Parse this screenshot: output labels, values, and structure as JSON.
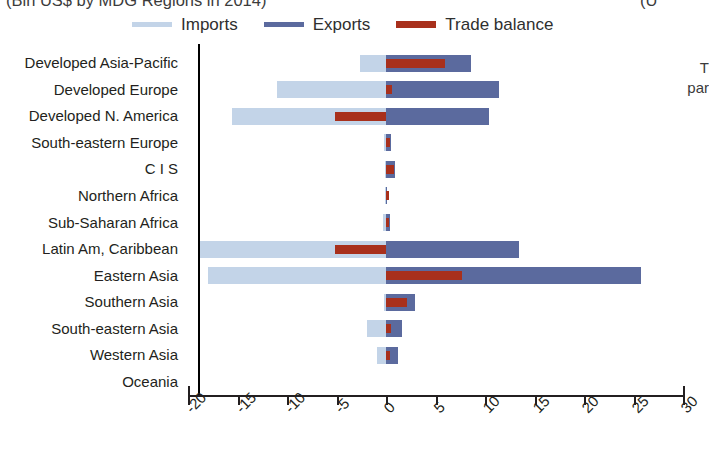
{
  "title": {
    "main_clipped": "(Bln US$ by MDG Regions in 2014)",
    "right_clipped": "(U"
  },
  "side_note": {
    "line1": "T",
    "line2": "par"
  },
  "legend": {
    "position": "top",
    "items": [
      {
        "label": "Imports",
        "color": "#c3d4e8"
      },
      {
        "label": "Exports",
        "color": "#5b6a9e"
      },
      {
        "label": "Trade balance",
        "color": "#a8301c"
      }
    ]
  },
  "chart_data": {
    "type": "bar",
    "orientation": "horizontal",
    "title": "(Bln US$ by MDG Regions in 2014)",
    "xlabel": "",
    "ylabel": "",
    "xlim": [
      -20,
      30
    ],
    "xticks": [
      -20,
      -15,
      -10,
      -5,
      0,
      5,
      10,
      15,
      20,
      25,
      30
    ],
    "xtick_labels": [
      "-20",
      "-15",
      "-10",
      "-5",
      "0",
      "5",
      "10",
      "15",
      "20",
      "25",
      "30"
    ],
    "grid": false,
    "legend_position": "top",
    "categories": [
      "Developed Asia-Pacific",
      "Developed Europe",
      "Developed N. America",
      "South-eastern Europe",
      "C I S",
      "Northern Africa",
      "Sub-Saharan Africa",
      "Latin Am, Caribbean",
      "Eastern Asia",
      "Southern Asia",
      "South-eastern Asia",
      "Western Asia",
      "Oceania"
    ],
    "series": [
      {
        "name": "Imports",
        "color": "#c3d4e8",
        "values": [
          -2.6,
          -11.0,
          -15.6,
          -0.2,
          -0.1,
          -0.1,
          -0.3,
          -19.0,
          -18.0,
          -0.2,
          -1.9,
          -0.9,
          0.0
        ]
      },
      {
        "name": "Exports",
        "color": "#5b6a9e",
        "values": [
          8.6,
          11.4,
          10.4,
          0.5,
          0.9,
          0.1,
          0.4,
          13.4,
          25.8,
          2.9,
          1.6,
          1.2,
          0.0
        ]
      },
      {
        "name": "Trade balance",
        "color": "#a8301c",
        "values": [
          6.0,
          0.6,
          -5.2,
          0.4,
          0.8,
          0.1,
          0.1,
          -5.2,
          7.7,
          2.1,
          0.5,
          0.4,
          0.0
        ]
      }
    ]
  }
}
